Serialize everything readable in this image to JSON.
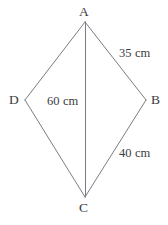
{
  "figure": {
    "shape_type": "kite",
    "background_color": "#ffffff",
    "line_color": "#7b7b85",
    "text_color": "#3b3b42",
    "vertices": [
      {
        "id": "A",
        "label": "A",
        "x": 85,
        "y": 22,
        "position": "top"
      },
      {
        "id": "B",
        "label": "B",
        "x": 146,
        "y": 100,
        "position": "right"
      },
      {
        "id": "C",
        "label": "C",
        "x": 85,
        "y": 197,
        "position": "bottom"
      },
      {
        "id": "D",
        "label": "D",
        "x": 25,
        "y": 100,
        "position": "left"
      }
    ],
    "edges": [
      {
        "id": "AB",
        "from": "A",
        "to": "B"
      },
      {
        "id": "BC",
        "from": "B",
        "to": "C"
      },
      {
        "id": "CD",
        "from": "C",
        "to": "D"
      },
      {
        "id": "DA",
        "from": "D",
        "to": "A"
      }
    ],
    "diagonals": [
      {
        "id": "AC",
        "from": "A",
        "to": "C"
      }
    ],
    "measurements": [
      {
        "id": "side-ab",
        "applies_to": "AB",
        "value": 35,
        "unit": "cm",
        "text": "35 cm"
      },
      {
        "id": "diag-ac",
        "applies_to": "AC",
        "value": 60,
        "unit": "cm",
        "text": "60 cm"
      },
      {
        "id": "side-bc",
        "applies_to": "BC",
        "value": 40,
        "unit": "cm",
        "text": "40 cm"
      }
    ]
  }
}
